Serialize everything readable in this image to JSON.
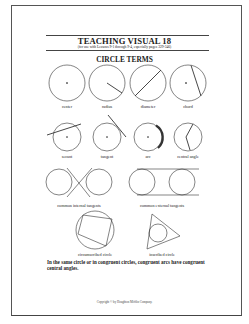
{
  "header": {
    "title": "TEACHING VISUAL 18",
    "subtitle": "(for use with Lessons 9-1 through 9-4, especially pages 329-346)",
    "heading": "CIRCLE TERMS"
  },
  "figures": {
    "row1": [
      {
        "label": "center"
      },
      {
        "label": "radius"
      },
      {
        "label": "diameter"
      },
      {
        "label": "chord"
      }
    ],
    "row2": [
      {
        "label": "secant"
      },
      {
        "label": "tangent"
      },
      {
        "label": "arc"
      },
      {
        "label": "central angle"
      }
    ],
    "row3": [
      {
        "label": "common internal tangents"
      },
      {
        "label": "common external tangents"
      }
    ],
    "row4": [
      {
        "label": "circumscribed circle"
      },
      {
        "label": "inscribed circle"
      }
    ]
  },
  "note": "In the same circle or in congruent circles, congruent arcs have congruent central angles.",
  "footer": {
    "copyright": "Copyright © by Houghton Mifflin Company."
  },
  "colors": {
    "ink": "#222222",
    "border": "#555555"
  }
}
